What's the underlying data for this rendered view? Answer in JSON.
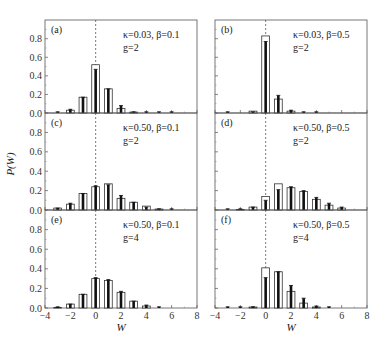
{
  "chart_data": {
    "type": "bar",
    "ylabel": "P(W)",
    "xlabel": "W",
    "xlim": [
      -4,
      8
    ],
    "ylim": [
      0,
      1.0
    ],
    "xticks": [
      -4,
      -2,
      0,
      2,
      4,
      6,
      8
    ],
    "yticks": [
      0.0,
      0.2,
      0.4,
      0.6,
      0.8
    ],
    "ytick_labels": [
      "0.0",
      "0.2",
      "0.4",
      "0.6",
      "0.8"
    ],
    "xtick_labels": [
      "−4",
      "−2",
      "0",
      "2",
      "4",
      "6",
      "8"
    ],
    "reference_line_x": 0,
    "panels": [
      {
        "label": "(a)",
        "params_line1": "κ=0.03, β=0.1",
        "params_line2": "g=2",
        "x": [
          -3,
          -2,
          -1,
          0,
          1,
          2,
          3,
          4,
          5,
          6
        ],
        "open_bars": [
          0.0,
          0.03,
          0.17,
          0.52,
          0.26,
          0.05,
          0.01,
          0.0,
          0.0,
          0.0
        ],
        "filled_bars": [
          0.01,
          0.04,
          0.17,
          0.47,
          0.26,
          0.08,
          0.01,
          0.005,
          0.005,
          0.005
        ]
      },
      {
        "label": "(b)",
        "params_line1": "κ=0.03, β=0.5",
        "params_line2": "g=2",
        "x": [
          -3,
          -2,
          -1,
          0,
          1,
          2,
          3,
          4,
          5,
          6
        ],
        "open_bars": [
          0.0,
          0.0,
          0.02,
          0.83,
          0.15,
          0.02,
          0.0,
          0.0,
          0.0,
          0.0
        ],
        "filled_bars": [
          0.005,
          0.0,
          0.01,
          0.77,
          0.19,
          0.03,
          0.005,
          0.005,
          0.0,
          0.0
        ]
      },
      {
        "label": "(c)",
        "params_line1": "κ=0.50, β=0.1",
        "params_line2": "g=2",
        "x": [
          -3,
          -2,
          -1,
          0,
          1,
          2,
          3,
          4,
          5,
          6
        ],
        "open_bars": [
          0.02,
          0.06,
          0.17,
          0.24,
          0.27,
          0.12,
          0.08,
          0.04,
          0.01,
          0.0
        ],
        "filled_bars": [
          0.02,
          0.07,
          0.17,
          0.25,
          0.26,
          0.15,
          0.08,
          0.03,
          0.01,
          0.005
        ]
      },
      {
        "label": "(d)",
        "params_line1": "κ=0.50, β=0.5",
        "params_line2": "g=2",
        "x": [
          -3,
          -2,
          -1,
          0,
          1,
          2,
          3,
          4,
          5,
          6
        ],
        "open_bars": [
          0.0,
          0.005,
          0.03,
          0.14,
          0.27,
          0.23,
          0.19,
          0.11,
          0.05,
          0.02
        ],
        "filled_bars": [
          0.005,
          0.005,
          0.03,
          0.1,
          0.21,
          0.24,
          0.2,
          0.13,
          0.07,
          0.03
        ]
      },
      {
        "label": "(e)",
        "params_line1": "κ=0.50, β=0.1",
        "params_line2": "g=4",
        "x": [
          -3,
          -2,
          -1,
          0,
          1,
          2,
          3,
          4,
          5,
          6
        ],
        "open_bars": [
          0.005,
          0.04,
          0.14,
          0.3,
          0.28,
          0.16,
          0.07,
          0.02,
          0.0,
          0.0
        ],
        "filled_bars": [
          0.01,
          0.04,
          0.14,
          0.31,
          0.29,
          0.17,
          0.07,
          0.03,
          0.005,
          0.0
        ]
      },
      {
        "label": "(f)",
        "params_line1": "κ=0.50, β=0.5",
        "params_line2": "g=4",
        "x": [
          -3,
          -2,
          -1,
          0,
          1,
          2,
          3,
          4,
          5,
          6
        ],
        "open_bars": [
          0.0,
          0.0,
          0.01,
          0.41,
          0.37,
          0.17,
          0.05,
          0.01,
          0.0,
          0.0
        ],
        "filled_bars": [
          0.005,
          0.005,
          0.01,
          0.31,
          0.37,
          0.23,
          0.1,
          0.02,
          0.005,
          0.0
        ]
      }
    ]
  }
}
